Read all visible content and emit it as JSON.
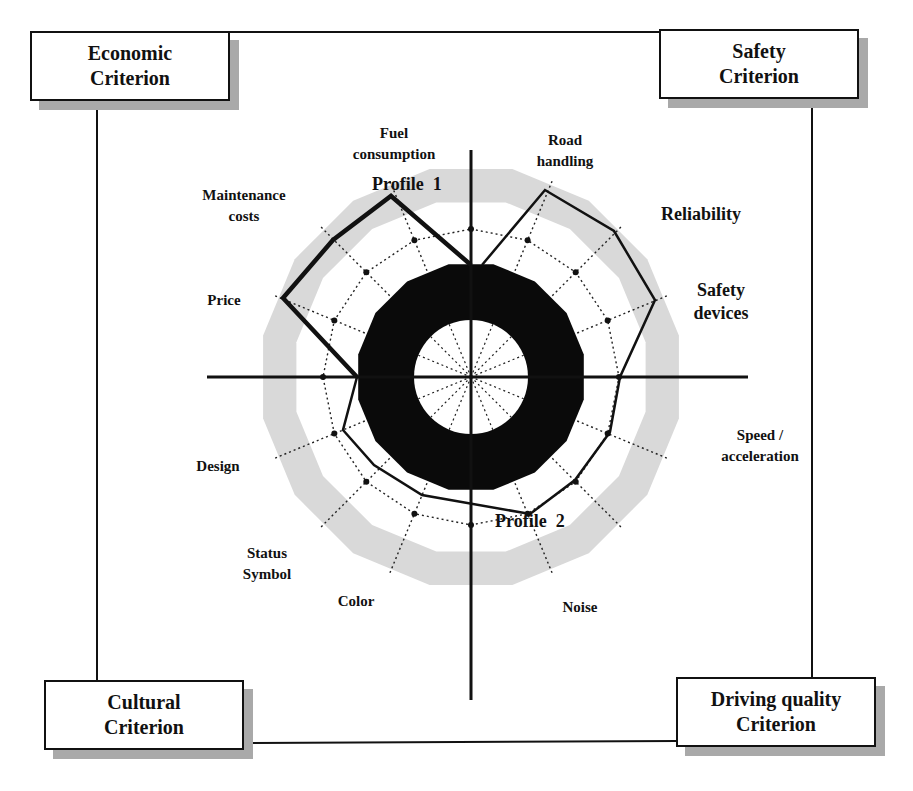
{
  "criteria": {
    "economic": {
      "line1": "Economic",
      "line2": "Criterion"
    },
    "safety": {
      "line1": "Safety",
      "line2": "Criterion"
    },
    "cultural": {
      "line1": "Cultural",
      "line2": "Criterion"
    },
    "driving_quality": {
      "line1": "Driving quality",
      "line2": "Criterion"
    }
  },
  "axes_labels": {
    "fuel_consumption": {
      "line1": "Fuel",
      "line2": "consumption"
    },
    "road_handling": {
      "line1": "Road",
      "line2": "handling"
    },
    "reliability": {
      "line1": "Reliability"
    },
    "safety_devices": {
      "line1": "Safety",
      "line2": "devices"
    },
    "speed_acceleration": {
      "line1": "Speed /",
      "line2": "acceleration"
    },
    "noise": {
      "line1": "Noise"
    },
    "color": {
      "line1": "Color"
    },
    "status_symbol": {
      "line1": "Status",
      "line2": "Symbol"
    },
    "design": {
      "line1": "Design"
    },
    "price": {
      "line1": "Price"
    },
    "maintenance_costs": {
      "line1": "Maintenance",
      "line2": "costs"
    }
  },
  "profiles": {
    "profile1": "Profile  1",
    "profile2": "Profile  2"
  },
  "colors": {
    "ink": "#111111",
    "grey_band": "#d9d9d9",
    "shadow": "#a9a9a9",
    "background": "#ffffff"
  },
  "chart_data": {
    "type": "radar",
    "title": "",
    "spokes": 16,
    "center": [
      471,
      377
    ],
    "quadrants": [
      "Economic Criterion",
      "Safety Criterion",
      "Driving quality Criterion",
      "Cultural Criterion"
    ],
    "axis_labels": [
      "Fuel consumption",
      "Road handling",
      "Reliability",
      "Safety devices",
      "Speed / acceleration",
      "Noise",
      "Color",
      "Status Symbol",
      "Design",
      "Price",
      "Maintenance costs"
    ],
    "rings": {
      "inner_white_radius": 57,
      "black_ring": [
        57,
        115
      ],
      "dotted_ring": 148,
      "grey_band": [
        178,
        212
      ]
    },
    "series": [
      {
        "name": "Profile 1",
        "style": "thick",
        "points_px": [
          [
            471,
            265
          ],
          [
            391,
            196
          ],
          [
            333,
            240
          ],
          [
            283,
            298
          ],
          [
            357,
            377
          ]
        ]
      },
      {
        "name": "Profile 2",
        "style": "thin",
        "points_px": [
          [
            482,
            265
          ],
          [
            545,
            190
          ],
          [
            614,
            231
          ],
          [
            655,
            300
          ],
          [
            620,
            377
          ],
          [
            610,
            432
          ],
          [
            575,
            480
          ],
          [
            530,
            514
          ],
          [
            422,
            495
          ],
          [
            374,
            465
          ],
          [
            343,
            430
          ],
          [
            357,
            377
          ]
        ]
      }
    ]
  }
}
